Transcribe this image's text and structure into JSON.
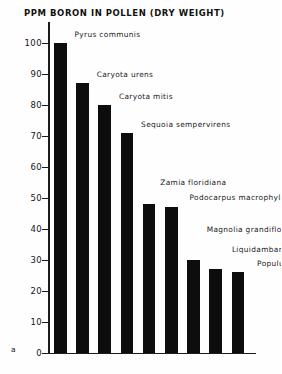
{
  "figure": {
    "title": "PPM BORON IN POLLEN (DRY WEIGHT)",
    "panel_letter": "a"
  },
  "axis": {
    "y_ticks": [
      "100",
      "90",
      "80",
      "70",
      "60",
      "50",
      "40",
      "30",
      "20",
      "10",
      "0"
    ]
  },
  "chart_data": {
    "type": "bar",
    "title": "PPM BORON IN POLLEN (DRY WEIGHT)",
    "xlabel": "",
    "ylabel": "PPM boron in pollen (dry weight)",
    "ylim": [
      0,
      105
    ],
    "yticks": [
      0,
      10,
      20,
      30,
      40,
      50,
      60,
      70,
      80,
      90,
      100
    ],
    "grid": false,
    "legend": "none",
    "categories": [
      "Pyrus communis",
      "Caryota urens",
      "Caryota mitis",
      "Sequoia sempervirens",
      "Zamia floridiana",
      "Podocarpus macrophyllus",
      "Magnolia grandiflora",
      "Liquidambar styraciflua",
      "Populus trichocarpa"
    ],
    "values": [
      100,
      87,
      80,
      71,
      48,
      47,
      30,
      27,
      26
    ],
    "annotations": [
      "Pyrus communis",
      "Caryota urens",
      "Caryota mitis",
      "Sequoia sempervirens",
      "Zamia floridiana",
      "Podocarpus macrophyllus",
      "Magnolia grandiflora",
      "Liquidambar styraciflua",
      "Populus trichocarpa"
    ],
    "bar_color": "#0d0d0d"
  }
}
